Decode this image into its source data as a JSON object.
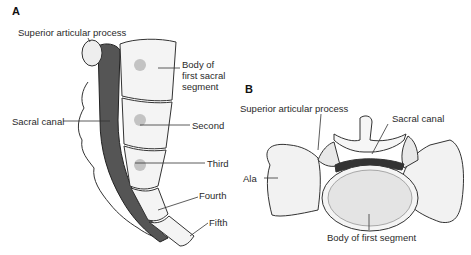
{
  "panels": [
    {
      "letter": "A",
      "labels": {
        "superior_articular_process": "Superior articular process",
        "body_first_line1": "Body of",
        "body_first_line2": "first sacral",
        "body_first_line3": "segment",
        "sacral_canal": "Sacral canal",
        "second": "Second",
        "third": "Third",
        "fourth": "Fourth",
        "fifth": "Fifth"
      }
    },
    {
      "letter": "B",
      "labels": {
        "superior_articular_process": "Superior articular process",
        "sacral_canal": "Sacral canal",
        "ala": "Ala",
        "body_first_segment": "Body of first segment"
      }
    }
  ]
}
